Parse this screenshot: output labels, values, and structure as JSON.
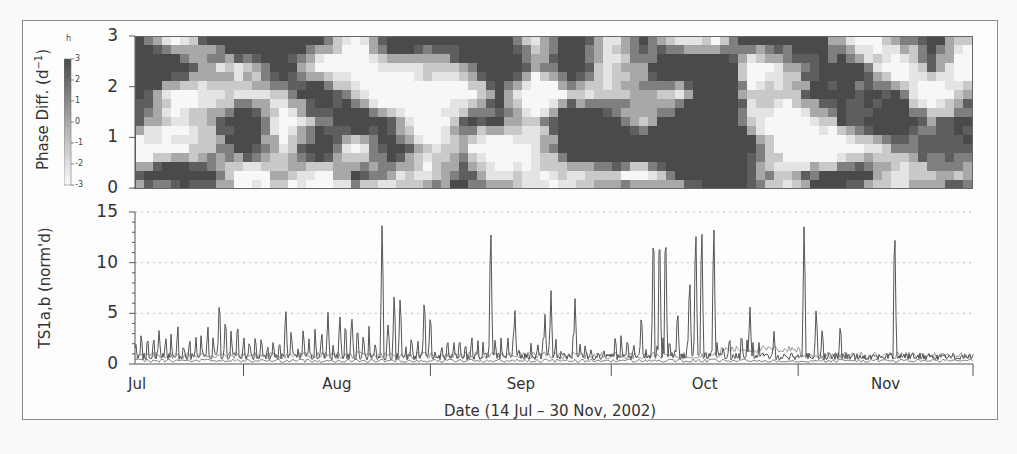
{
  "figure": {
    "top_panel": {
      "ylabel": "Phase Diff. (d",
      "ylabel_sup": "−1",
      "ylabel_close": ")",
      "yticks": [
        "3",
        "2",
        "1",
        "0"
      ],
      "colorbar": {
        "title": "h",
        "ticks": [
          "3",
          "2",
          "1",
          "0",
          "-1",
          "-2",
          "-3"
        ]
      }
    },
    "bottom_panel": {
      "ylabel": "TS1a,b (norm'd)",
      "yticks": [
        "15",
        "10",
        "5",
        "0"
      ],
      "months": [
        "Jul",
        "Aug",
        "Sep",
        "Oct",
        "Nov"
      ],
      "xlabel": "Date (14 Jul – 30 Nov, 2002)"
    }
  },
  "colors": {
    "frame": "#8a8a8a",
    "axis": "#555555",
    "series_dark": "#555555",
    "series_light": "#9a9a9a",
    "grid": "#bbbbbb",
    "heat_levels": [
      "#f7f7f7",
      "#e4e4e4",
      "#c9c9c9",
      "#a8a8a8",
      "#7f7f7f",
      "#5e5e5e",
      "#4a4a4a"
    ]
  },
  "chart_data": [
    {
      "type": "heatmap",
      "title": "",
      "xlabel": "",
      "ylabel": "Phase Diff. (d^-1)",
      "ylim": [
        0,
        3
      ],
      "yticks": [
        0,
        1,
        2,
        3
      ],
      "colorbar": {
        "label": "h",
        "range": [
          -3,
          3
        ],
        "ticks": [
          3,
          2,
          1,
          0,
          -1,
          -2,
          -3
        ]
      },
      "x_range": "14 Jul – 30 Nov 2002",
      "grid": false,
      "note": "Greyscale field of phase-difference values; dark ≈ +3, white ≈ -3; patchy blocky structure across the period"
    },
    {
      "type": "line",
      "title": "",
      "xlabel": "Date (14 Jul – 30 Nov, 2002)",
      "ylabel": "TS1a,b (norm'd)",
      "ylim": [
        0,
        15
      ],
      "yticks": [
        0,
        5,
        10,
        15
      ],
      "x_ticks": [
        "Jul",
        "Aug",
        "Sep",
        "Oct",
        "Nov"
      ],
      "grid": true,
      "series": [
        {
          "name": "TS1a",
          "baseline": 0.8,
          "peaks": [
            {
              "date": "2002-07-18",
              "value": 3.5
            },
            {
              "date": "2002-07-28",
              "value": 7.0
            },
            {
              "date": "2002-07-29",
              "value": 5.0
            },
            {
              "date": "2002-08-08",
              "value": 6.0
            },
            {
              "date": "2002-08-15",
              "value": 5.3
            },
            {
              "date": "2002-08-17",
              "value": 4.7
            },
            {
              "date": "2002-08-19",
              "value": 4.5
            },
            {
              "date": "2002-08-24",
              "value": 15.0
            },
            {
              "date": "2002-08-25",
              "value": 4.3
            },
            {
              "date": "2002-08-26",
              "value": 7.5
            },
            {
              "date": "2002-08-27",
              "value": 7.3
            },
            {
              "date": "2002-08-31",
              "value": 7.2
            },
            {
              "date": "2002-09-01",
              "value": 5.5
            },
            {
              "date": "2002-09-11",
              "value": 15.0
            },
            {
              "date": "2002-09-15",
              "value": 5.8
            },
            {
              "date": "2002-09-20",
              "value": 5.0
            },
            {
              "date": "2002-09-21",
              "value": 7.3
            },
            {
              "date": "2002-09-25",
              "value": 6.8
            },
            {
              "date": "2002-10-06",
              "value": 5.5
            },
            {
              "date": "2002-10-08",
              "value": 15.0
            },
            {
              "date": "2002-10-09",
              "value": 15.0
            },
            {
              "date": "2002-10-10",
              "value": 15.0
            },
            {
              "date": "2002-10-12",
              "value": 6.0
            },
            {
              "date": "2002-10-14",
              "value": 9.5
            },
            {
              "date": "2002-10-15",
              "value": 15.0
            },
            {
              "date": "2002-10-16",
              "value": 15.0
            },
            {
              "date": "2002-10-18",
              "value": 15.0
            },
            {
              "date": "2002-10-24",
              "value": 5.8
            },
            {
              "date": "2002-10-28",
              "value": 3.3
            },
            {
              "date": "2002-11-02",
              "value": 15.0
            },
            {
              "date": "2002-11-04",
              "value": 6.0
            },
            {
              "date": "2002-11-05",
              "value": 3.8
            },
            {
              "date": "2002-11-08",
              "value": 4.3
            },
            {
              "date": "2002-11-17",
              "value": 15.0
            }
          ]
        },
        {
          "name": "TS1b",
          "baseline": 0.5,
          "note": "Low-amplitude series mostly 0–2, slightly elevated (~1–1.5) in early October and late November"
        }
      ]
    }
  ]
}
